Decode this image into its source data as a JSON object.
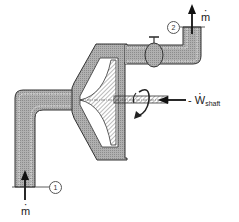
{
  "diagram": {
    "type": "centrifugal compressor / pump control volume",
    "labels": {
      "inlet_state": "1",
      "outlet_state": "2",
      "inlet_flow": "m",
      "outlet_flow": "m",
      "shaft_work_prefix": "- ",
      "shaft_work_symbol": "W",
      "shaft_work_subscript": "shaft"
    },
    "colors": {
      "fluid_fill": "#a8a8a8",
      "outline": "#333333",
      "control_surface": "#ffffff",
      "impeller_hatch": "#555555"
    }
  }
}
